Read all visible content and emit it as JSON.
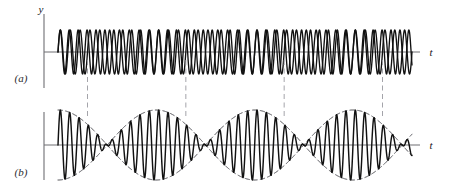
{
  "figure": {
    "background_color": "#ffffff",
    "wave_color": "#111111",
    "axis_color": "#6e6e73",
    "envelope_color": "#3a3a40",
    "guide_color": "#9a9aa0"
  },
  "panels": [
    {
      "id": "a",
      "label": "(a)",
      "y_axis_label": "y",
      "t_axis_label": "t",
      "description": "two separate sine waves of slightly different frequencies drawn superimposed"
    },
    {
      "id": "b",
      "label": "(b)",
      "y_axis_label": "",
      "t_axis_label": "t",
      "description": "resultant sum wave showing beat envelope with nodes and antinodes"
    }
  ],
  "chart_data": {
    "type": "line",
    "xlabel": "t",
    "ylabel": "y",
    "grid": false,
    "legend": null,
    "xlim": [
      0,
      36
    ],
    "ylim": [
      -2.1,
      2.1
    ],
    "annotations": [
      {
        "text": "(a)",
        "role": "panel-label"
      },
      {
        "text": "(b)",
        "role": "panel-label"
      },
      {
        "text": "y",
        "role": "axis-label"
      },
      {
        "text": "t",
        "role": "axis-label"
      },
      {
        "text": "t",
        "role": "axis-label"
      }
    ],
    "parameters": {
      "frequency_1": 1.0,
      "frequency_2": 1.1,
      "amplitude_1": 1.0,
      "amplitude_2": 1.0,
      "beat_frequency": 0.1,
      "cycles_visible": 36,
      "beat_periods_visible": 2
    },
    "nodes_t": [
      3.0,
      13.0,
      23.0,
      33.0
    ],
    "antinodes_t": [
      8.0,
      18.0,
      28.0
    ],
    "guide_lines_t": [
      3.0,
      13.0,
      23.0,
      33.0
    ],
    "panel_a": {
      "series": [
        {
          "name": "wave 1",
          "frequency": 1.0,
          "amplitude": 1.0,
          "phase": 0
        },
        {
          "name": "wave 2",
          "frequency": 1.1,
          "amplitude": 1.0,
          "phase": 0
        }
      ]
    },
    "panel_b": {
      "series": [
        {
          "name": "resultant",
          "expression": "sin(w1 t) + sin(w2 t)",
          "amplitude_max": 2.0
        },
        {
          "name": "envelope upper",
          "expression": "2 cos((w2-w1) t / 2)",
          "style": "dashed"
        },
        {
          "name": "envelope lower",
          "expression": "-2 cos((w2-w1) t / 2)",
          "style": "dashed"
        }
      ]
    }
  }
}
